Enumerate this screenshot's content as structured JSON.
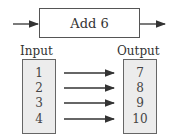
{
  "diagram": {
    "function_label": "Add 6",
    "input_label": "Input",
    "output_label": "Output",
    "rows": [
      {
        "input": "1",
        "output": "7"
      },
      {
        "input": "2",
        "output": "8"
      },
      {
        "input": "3",
        "output": "9"
      },
      {
        "input": "4",
        "output": "10"
      }
    ]
  },
  "colors": {
    "stroke": "#333333",
    "box_fill": "#ececec"
  }
}
